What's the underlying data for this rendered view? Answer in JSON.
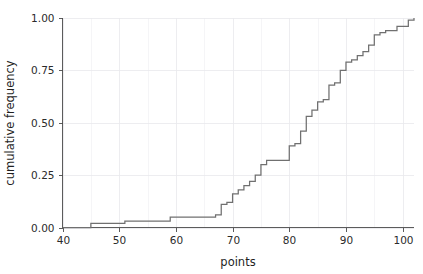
{
  "chart_data": {
    "type": "line",
    "subtype": "ecdf-step",
    "title": "",
    "subtitle": "",
    "xlabel": "points",
    "ylabel": "cumulative frequency",
    "xlim": [
      40,
      102
    ],
    "ylim": [
      0.0,
      1.0
    ],
    "grid": true,
    "legend": null,
    "legend_position": "none",
    "line_color": "#707070",
    "background_color": "#ffffff",
    "grid_color": "#e9e9ec",
    "xticks": [
      40,
      50,
      60,
      70,
      80,
      90,
      100
    ],
    "xticklabels": [
      "40",
      "50",
      "60",
      "70",
      "80",
      "90",
      "100"
    ],
    "xticks_minor": [
      45,
      55,
      65,
      75,
      85,
      95
    ],
    "yticks": [
      0.0,
      0.25,
      0.5,
      0.75,
      1.0
    ],
    "yticklabels": [
      "0.00",
      "0.25",
      "0.50",
      "0.75",
      "1.00"
    ],
    "x": [
      40,
      45,
      51,
      59,
      67,
      68,
      69,
      70,
      71,
      72,
      73,
      74,
      75,
      76,
      80,
      81,
      82,
      83,
      84,
      85,
      86,
      87,
      88,
      89,
      90,
      91,
      92,
      93,
      94,
      95,
      96,
      97,
      99,
      101,
      102
    ],
    "values": [
      0.0,
      0.02,
      0.03,
      0.05,
      0.06,
      0.11,
      0.12,
      0.16,
      0.18,
      0.2,
      0.22,
      0.25,
      0.3,
      0.32,
      0.39,
      0.4,
      0.46,
      0.53,
      0.56,
      0.6,
      0.61,
      0.68,
      0.69,
      0.75,
      0.79,
      0.8,
      0.82,
      0.84,
      0.87,
      0.92,
      0.93,
      0.94,
      0.96,
      0.99,
      1.0
    ],
    "series": [
      {
        "name": "cumulative frequency",
        "x": [
          40,
          45,
          51,
          59,
          67,
          68,
          69,
          70,
          71,
          72,
          73,
          74,
          75,
          76,
          80,
          81,
          82,
          83,
          84,
          85,
          86,
          87,
          88,
          89,
          90,
          91,
          92,
          93,
          94,
          95,
          96,
          97,
          99,
          101,
          102
        ],
        "values": [
          0.0,
          0.02,
          0.03,
          0.05,
          0.06,
          0.11,
          0.12,
          0.16,
          0.18,
          0.2,
          0.22,
          0.25,
          0.3,
          0.32,
          0.39,
          0.4,
          0.46,
          0.53,
          0.56,
          0.6,
          0.61,
          0.68,
          0.69,
          0.75,
          0.79,
          0.8,
          0.82,
          0.84,
          0.87,
          0.92,
          0.93,
          0.94,
          0.96,
          0.99,
          1.0
        ]
      }
    ],
    "annotations": []
  }
}
